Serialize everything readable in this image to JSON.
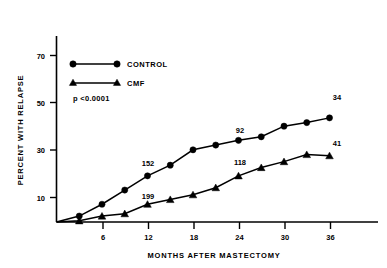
{
  "chart_data": {
    "type": "line",
    "title": "",
    "xlabel": "MONTHS AFTER MASTECTOMY",
    "ylabel": "PERCENT WITH RELAPSE",
    "xlim": [
      0,
      42
    ],
    "ylim": [
      0,
      78
    ],
    "xticks": [
      6,
      12,
      18,
      24,
      30,
      36
    ],
    "yticks": [
      10,
      30,
      50,
      70
    ],
    "grid": false,
    "legend_position": "upper-left",
    "x": [
      0,
      3,
      6,
      9,
      12,
      15,
      18,
      21,
      24,
      27,
      30,
      33,
      36
    ],
    "series": [
      {
        "name": "CONTROL",
        "marker": "circle",
        "values": [
          0,
          2.5,
          7.5,
          13.5,
          19.5,
          24,
          30.5,
          32.5,
          34.5,
          36,
          40.5,
          42,
          44
        ]
      },
      {
        "name": "CMF",
        "marker": "triangle",
        "values": [
          0,
          0.5,
          2.5,
          3.5,
          7.5,
          9.5,
          11.5,
          14.5,
          19.5,
          23,
          25.5,
          28.5,
          28
        ]
      }
    ],
    "annotations": [
      {
        "text": "152",
        "x": 12,
        "y": 25,
        "series": "CONTROL"
      },
      {
        "text": "92",
        "x": 24,
        "y": 40,
        "series": "CONTROL"
      },
      {
        "text": "34",
        "x": 36,
        "y": 54,
        "series": "CONTROL"
      },
      {
        "text": "199",
        "x": 12,
        "y": 13,
        "series": "CMF"
      },
      {
        "text": "118",
        "x": 24,
        "y": 25,
        "series": "CMF"
      },
      {
        "text": "41",
        "x": 36,
        "y": 33,
        "series": "CMF"
      }
    ],
    "pvalue_text": "p  <0.0001",
    "colors": {
      "control": "#000000",
      "cmf": "#000000",
      "background": "#ffffff"
    }
  },
  "axes": {
    "ylabel": "PERCENT WITH RELAPSE",
    "xlabel": "MONTHS AFTER MASTECTOMY",
    "ytick_labels": [
      "10",
      "30",
      "50",
      "70"
    ],
    "xtick_labels": [
      "6",
      "12",
      "18",
      "24",
      "30",
      "36"
    ]
  },
  "legend": {
    "entries": [
      {
        "label": "CONTROL",
        "marker": "circle"
      },
      {
        "label": "CMF",
        "marker": "triangle"
      }
    ],
    "pvalue": "p  <0.0001"
  },
  "annotation_labels": {
    "control_12": "152",
    "control_24": "92",
    "control_36": "34",
    "cmf_12": "199",
    "cmf_24": "118",
    "cmf_36": "41"
  }
}
